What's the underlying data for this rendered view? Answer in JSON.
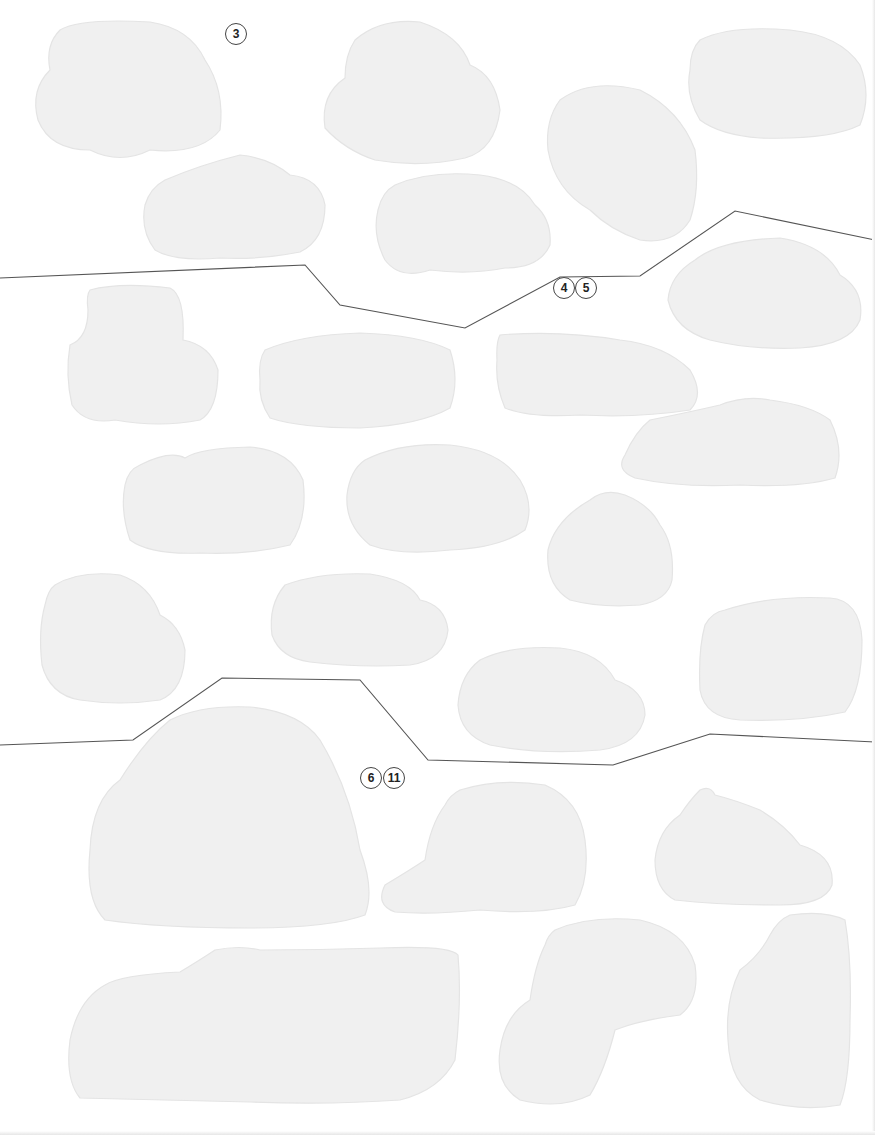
{
  "page": {
    "background": "#ffffff",
    "sticker_fill": "#f0f0f0",
    "divider_color": "#555555",
    "badge_border_color": "#444444"
  },
  "sections": [
    {
      "id": "top",
      "labels": [
        {
          "text": "3",
          "x": 236,
          "y": 34
        }
      ]
    },
    {
      "id": "middle",
      "labels": [
        {
          "text": "4",
          "x": 564,
          "y": 288
        },
        {
          "text": "5",
          "x": 586,
          "y": 288
        }
      ]
    },
    {
      "id": "bottom",
      "labels": [
        {
          "text": "6",
          "x": 371,
          "y": 778
        },
        {
          "text": "11",
          "x": 394,
          "y": 778
        }
      ]
    }
  ],
  "dividers": [
    {
      "name": "divider-top-middle",
      "points": "0,278 305,265 340,305 465,328 560,277 640,276 735,211 875,240"
    },
    {
      "name": "divider-middle-bottom",
      "points": "0,745 133,740 222,678 360,680 428,760 613,765 710,734 875,742"
    }
  ],
  "stickers": [
    {
      "name": "sticker-car-1",
      "d": "M60,30 Q80,18 150,22 Q190,28 205,60 Q225,90 220,130 Q200,155 150,150 Q120,165 90,150 Q50,150 38,120 Q30,90 50,70 Q45,45 60,30 Z"
    },
    {
      "name": "sticker-car-2",
      "d": "M355,40 Q380,18 420,22 Q460,35 470,65 Q495,75 500,110 Q495,150 465,158 Q420,168 375,160 Q345,150 325,128 Q320,95 345,78 Q345,55 355,40 Z"
    },
    {
      "name": "sticker-car-3",
      "d": "M700,40 Q730,25 790,30 Q840,35 860,65 Q872,95 860,125 Q830,140 760,138 Q720,135 700,120 Q685,95 690,70 Q690,50 700,40 Z"
    },
    {
      "name": "sticker-car-4",
      "d": "M560,100 Q590,78 640,90 Q680,110 695,150 Q700,190 690,220 Q675,245 640,240 Q610,230 590,210 Q555,190 548,150 Q545,120 560,100 Z"
    },
    {
      "name": "sticker-car-5",
      "d": "M165,180 Q200,165 240,155 Q270,158 290,175 Q320,178 325,205 Q325,240 300,252 Q260,260 220,258 Q175,262 155,250 Q140,230 145,205 Q150,188 165,180 Z"
    },
    {
      "name": "sticker-car-6",
      "d": "M395,185 Q430,170 480,175 Q520,180 535,205 Q552,220 550,245 Q540,268 505,268 Q470,275 430,270 Q400,280 385,260 Q372,235 378,210 Q382,192 395,185 Z"
    },
    {
      "name": "sticker-car-7",
      "d": "M695,260 Q720,240 780,238 Q825,245 840,275 Q865,290 860,320 Q850,345 800,348 Q750,350 710,340 Q675,330 668,300 Q670,275 695,260 Z"
    },
    {
      "name": "sticker-car-8",
      "d": "M90,290 Q120,282 170,288 Q185,295 183,340 Q210,345 218,370 Q218,410 200,420 Q160,428 115,420 Q85,425 72,405 Q65,375 70,345 Q88,338 88,310 Q86,295 90,290 Z"
    },
    {
      "name": "sticker-car-9",
      "d": "M265,350 Q300,335 360,333 Q420,335 450,350 Q460,380 450,408 Q420,425 360,428 Q300,428 270,418 Q258,400 260,380 Q258,360 265,350 Z"
    },
    {
      "name": "sticker-car-10",
      "d": "M500,335 Q560,330 620,340 Q665,345 690,370 Q705,395 690,410 Q640,418 580,415 Q530,418 505,408 Q495,385 497,360 Q496,342 500,335 Z"
    },
    {
      "name": "sticker-car-11",
      "d": "M650,420 Q690,412 720,405 Q745,395 770,400 Q810,405 830,420 Q845,450 835,478 Q800,488 740,485 Q680,488 635,478 Q615,470 625,455 Q635,432 650,420 Z"
    },
    {
      "name": "sticker-car-12",
      "d": "M140,465 Q170,450 185,458 Q200,448 250,447 Q290,450 303,480 Q308,520 290,545 Q250,555 200,553 Q150,555 130,540 Q120,510 125,485 Q128,470 140,465 Z"
    },
    {
      "name": "sticker-car-13",
      "d": "M365,460 Q400,442 450,445 Q500,450 520,480 Q535,505 525,530 Q500,548 450,550 Q400,556 370,545 Q345,525 347,495 Q350,470 365,460 Z"
    },
    {
      "name": "sticker-car-14",
      "d": "M590,500 Q605,488 625,495 Q650,505 660,525 Q675,545 672,580 Q668,600 640,605 Q600,608 570,600 Q545,585 548,550 Q555,520 590,500 Z"
    },
    {
      "name": "sticker-car-15",
      "d": "M55,585 Q80,570 120,575 Q150,585 160,615 Q180,625 185,650 Q185,690 160,700 Q120,706 80,700 Q50,695 42,665 Q38,630 45,605 Q48,590 55,585 Z"
    },
    {
      "name": "sticker-car-16",
      "d": "M285,585 Q320,572 370,574 Q410,580 420,600 Q445,605 448,630 Q445,660 410,665 Q360,668 310,662 Q280,658 272,635 Q268,605 285,585 Z"
    },
    {
      "name": "sticker-car-17",
      "d": "M480,660 Q510,645 560,648 Q600,652 615,680 Q645,690 645,715 Q640,745 600,750 Q540,755 490,745 Q460,735 458,705 Q460,675 480,660 Z"
    },
    {
      "name": "sticker-car-18",
      "d": "M725,610 Q770,595 830,598 Q860,600 862,640 Q862,690 845,712 Q800,722 740,720 Q705,718 700,690 Q698,650 705,625 Q712,612 725,610 Z"
    },
    {
      "name": "sticker-car-19",
      "d": "M170,720 Q200,705 250,707 Q300,712 320,740 Q350,790 360,850 Q375,890 365,915 Q330,928 250,928 Q160,928 105,920 Q85,900 90,850 Q92,800 120,780 Q145,740 170,720 Z"
    },
    {
      "name": "sticker-car-20",
      "d": "M460,790 Q500,778 545,785 Q580,800 585,840 Q590,880 575,905 Q540,915 480,910 Q430,915 395,912 Q375,905 385,885 Q410,870 425,860 Q430,825 445,805 Q450,795 460,790 Z"
    },
    {
      "name": "sticker-car-21",
      "d": "M700,790 Q710,785 715,795 Q735,800 760,810 Q785,825 800,845 Q835,855 832,885 Q825,905 780,905 Q720,905 675,900 Q655,890 655,860 Q658,830 680,815 Q690,800 700,790 Z"
    },
    {
      "name": "sticker-car-22",
      "d": "M105,985 Q120,975 180,972 Q200,960 215,950 Q240,945 260,950 Q320,950 380,948 Q450,945 458,955 Q462,1000 455,1060 Q440,1090 400,1100 Q330,1105 250,1102 Q150,1100 80,1098 Q65,1080 70,1040 Q78,1000 105,985 Z"
    },
    {
      "name": "sticker-car-23",
      "d": "M555,930 Q590,915 640,920 Q685,930 695,965 Q700,1000 680,1015 Q640,1020 615,1030 Q605,1070 590,1095 Q560,1110 520,1100 Q495,1085 500,1050 Q505,1015 530,1000 Q535,965 545,945 Q548,935 555,930 Z"
    },
    {
      "name": "sticker-car-24",
      "d": "M790,915 Q825,910 845,920 Q852,960 850,1020 Q850,1080 840,1105 Q800,1112 760,1100 Q730,1085 728,1040 Q725,1000 740,970 Q760,955 770,935 Q778,920 790,915 Z"
    }
  ]
}
